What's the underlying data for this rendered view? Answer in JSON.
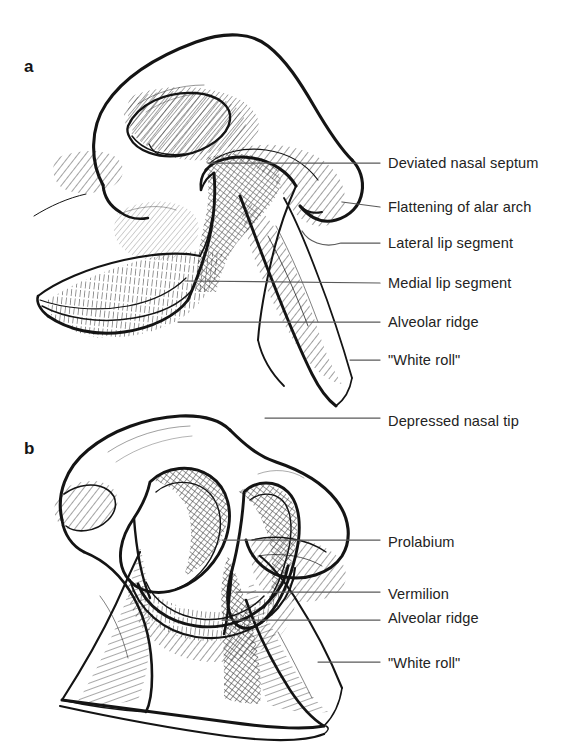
{
  "figure": {
    "background_color": "#ffffff",
    "ink_color": "#141414",
    "leader_line_color": "#5a5a5a",
    "label_color": "#232323",
    "width": 576,
    "height": 751,
    "style": "pen-and-ink medical line drawing with hatched shading"
  },
  "panels": [
    {
      "id": "a",
      "letter": "a",
      "subject": "Unilateral cleft lip and nose, worm's-eye (basal) view",
      "labels": [
        {
          "id": "deviated-nasal-septum",
          "text": "Deviated nasal septum",
          "x": 388,
          "y": 163,
          "leader": {
            "x1": 208,
            "y1": 163,
            "x2": 380,
            "y2": 163,
            "type": "straight"
          }
        },
        {
          "id": "flattening-of-alar-arch",
          "text": "Flattening of alar arch",
          "x": 388,
          "y": 207,
          "leader": {
            "x1": 342,
            "y1": 202,
            "x2": 380,
            "y2": 207,
            "type": "straight"
          }
        },
        {
          "id": "lateral-lip-segment",
          "text": "Lateral lip segment",
          "x": 388,
          "y": 243,
          "leader": {
            "x1": 302,
            "y1": 243,
            "x2": 380,
            "y2": 243,
            "type": "curved"
          }
        },
        {
          "id": "medial-lip-segment",
          "text": "Medial lip segment",
          "x": 388,
          "y": 283,
          "leader": {
            "x1": 185,
            "y1": 281,
            "x2": 380,
            "y2": 283,
            "type": "straight"
          }
        },
        {
          "id": "alveolar-ridge",
          "text": "Alveolar ridge",
          "x": 388,
          "y": 322,
          "leader": {
            "x1": 178,
            "y1": 322,
            "x2": 380,
            "y2": 322,
            "type": "straight"
          }
        },
        {
          "id": "white-roll",
          "text": "\"White roll\"",
          "x": 388,
          "y": 360,
          "leader": {
            "x1": 350,
            "y1": 360,
            "x2": 380,
            "y2": 360,
            "type": "straight"
          }
        }
      ]
    },
    {
      "id": "b",
      "letter": "b",
      "subject": "Bilateral cleft lip with prolabium, worm's-eye (basal) view",
      "labels": [
        {
          "id": "depressed-nasal-tip",
          "text": "Depressed nasal tip",
          "x": 388,
          "y": 421,
          "leader": {
            "x1": 265,
            "y1": 418,
            "x2": 380,
            "y2": 418,
            "type": "straight"
          }
        },
        {
          "id": "prolabium",
          "text": "Prolabium",
          "x": 388,
          "y": 542,
          "leader": {
            "x1": 222,
            "y1": 540,
            "x2": 380,
            "y2": 540,
            "type": "straight"
          }
        },
        {
          "id": "vermilion",
          "text": "Vermilion",
          "x": 388,
          "y": 594,
          "leader": {
            "x1": 236,
            "y1": 592,
            "x2": 380,
            "y2": 592,
            "type": "straight"
          }
        },
        {
          "id": "alveolar-ridge-b",
          "text": "Alveolar ridge",
          "x": 388,
          "y": 618,
          "leader": {
            "x1": 222,
            "y1": 620,
            "x2": 380,
            "y2": 620,
            "type": "straight"
          }
        },
        {
          "id": "white-roll-b",
          "text": "\"White roll\"",
          "x": 388,
          "y": 663,
          "leader": {
            "x1": 318,
            "y1": 662,
            "x2": 380,
            "y2": 662,
            "type": "straight"
          }
        }
      ]
    }
  ]
}
